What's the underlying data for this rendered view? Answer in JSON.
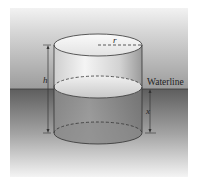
{
  "diagram": {
    "type": "floating-cylinder",
    "labels": {
      "radius": "r",
      "height": "h",
      "submerged_depth": "x",
      "waterline": "Waterline"
    },
    "colors": {
      "air_top": "#d8d8d8",
      "air_bottom": "#9a9a9a",
      "water_top": "#6e6e6e",
      "water_bottom": "#f0f0f0",
      "cylinder_light": "#f2f2f2",
      "cylinder_dark": "#a8a8a8",
      "line": "#333333"
    }
  }
}
